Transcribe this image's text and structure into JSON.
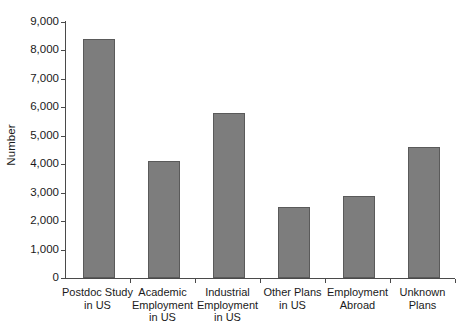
{
  "chart_data": {
    "type": "bar",
    "title": "",
    "subtitle": "",
    "xlabel": "",
    "ylabel": "Number",
    "ylim": [
      0,
      9000
    ],
    "ytick_step": 1000,
    "grid": false,
    "legend": null,
    "orientation": "vertical",
    "categories": [
      "Postdoc Study\nin US",
      "Academic\nEmployment\nin US",
      "Industrial\nEmployment\nin US",
      "Other Plans\nin US",
      "Employment\nAbroad",
      "Unknown\nPlans"
    ],
    "values": [
      8400,
      4100,
      5800,
      2500,
      2900,
      4600
    ],
    "ytick_labels": [
      "0",
      "1,000",
      "2,000",
      "3,000",
      "4,000",
      "5,000",
      "6,000",
      "7,000",
      "8,000",
      "9,000"
    ],
    "ytick_values": [
      0,
      1000,
      2000,
      3000,
      4000,
      5000,
      6000,
      7000,
      8000,
      9000
    ],
    "colors": {
      "bar_fill": "#7d7d7d",
      "bar_stroke": "#5a5a5a",
      "axis": "#4a4a4a",
      "text": "#1a1a1a",
      "background": "#ffffff"
    }
  }
}
